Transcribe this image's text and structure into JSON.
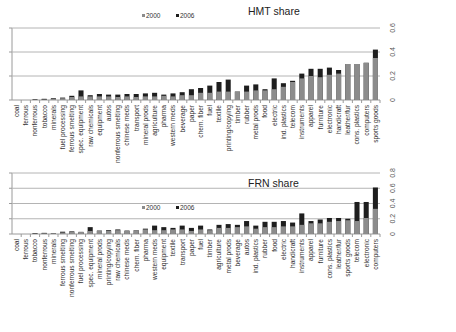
{
  "chart_data": [
    {
      "type": "bar",
      "stacked": "overlay",
      "title": "HMT share",
      "xlabel": "",
      "ylabel": "",
      "ylim": [
        0,
        0.6
      ],
      "yticks": [
        0,
        0.2,
        0.4,
        0.6
      ],
      "ytick_labels": [
        "0",
        "0.2",
        "0.4",
        "0.6"
      ],
      "grid": true,
      "legend": {
        "position": "inside-top-center",
        "entries": [
          "2000",
          "2006"
        ]
      },
      "categories": [
        "coal",
        "ferrous",
        "nonferrous",
        "tobacco",
        "minerals",
        "fuel processing",
        "ferrous smelting",
        "spec. equipment",
        "raw chemicals",
        "equipment",
        "autos",
        "nonferrous smelting",
        "chinese meds",
        "transport",
        "mineral prods",
        "agriculture",
        "pharma",
        "western meds",
        "beverage",
        "paper",
        "chem. fiber",
        "fuel",
        "textile",
        "printing/copying",
        "timber",
        "rubber",
        "metal prods",
        "food",
        "electric",
        "ind. plastics",
        "telecom",
        "instruments",
        "apparel",
        "furniture",
        "electronic",
        "handicraft",
        "leather/fur",
        "cons. plastics",
        "computers",
        "sports goods"
      ],
      "series": [
        {
          "name": "2000",
          "color": "#8c8c8c",
          "values": [
            0.0,
            0.0,
            0.0,
            0.005,
            0.01,
            0.015,
            0.025,
            0.03,
            0.03,
            0.03,
            0.03,
            0.025,
            0.03,
            0.025,
            0.03,
            0.03,
            0.035,
            0.03,
            0.04,
            0.04,
            0.06,
            0.06,
            0.07,
            0.07,
            0.07,
            0.07,
            0.08,
            0.08,
            0.09,
            0.11,
            0.15,
            0.18,
            0.2,
            0.19,
            0.21,
            0.22,
            0.3,
            0.3,
            0.31,
            0.35
          ]
        },
        {
          "name": "2006",
          "color": "#1e1e1e",
          "values": [
            0.0,
            0.0,
            0.005,
            0.01,
            0.015,
            0.02,
            0.035,
            0.08,
            0.04,
            0.05,
            0.045,
            0.045,
            0.05,
            0.05,
            0.055,
            0.06,
            0.045,
            0.055,
            0.065,
            0.09,
            0.1,
            0.12,
            0.15,
            0.17,
            0.07,
            0.12,
            0.13,
            0.09,
            0.18,
            0.14,
            0.16,
            0.22,
            0.26,
            0.26,
            0.27,
            0.25,
            0.3,
            0.3,
            0.31,
            0.42
          ]
        }
      ]
    },
    {
      "type": "bar",
      "stacked": "overlay",
      "title": "FRN share",
      "xlabel": "",
      "ylabel": "",
      "ylim": [
        0,
        0.8
      ],
      "yticks": [
        0,
        0.2,
        0.4,
        0.6,
        0.8
      ],
      "ytick_labels": [
        "0",
        "0.2",
        "0.4",
        "0.6",
        "0.8"
      ],
      "grid": true,
      "legend": {
        "position": "inside-top-center",
        "entries": [
          "2000",
          "2006"
        ]
      },
      "categories": [
        "coal",
        "ferrous",
        "tobacco",
        "nonferrous",
        "minerals",
        "ferrous smelting",
        "nonferrous smelting",
        "fuel processing",
        "spec. equipment",
        "mineral prods",
        "printing/copying",
        "raw chemicals",
        "chinese meds",
        "chem. fiber",
        "pharma",
        "western meds",
        "equipment",
        "textile",
        "transport",
        "paper",
        "fuel",
        "timber",
        "agriculture",
        "metal prods",
        "beverage",
        "autos",
        "ind. plastics",
        "rubber",
        "food",
        "electric",
        "handicraft",
        "instruments",
        "apparel",
        "furniture",
        "cons. plastics",
        "leather/fur",
        "sports goods",
        "telecom",
        "electronic",
        "computers"
      ],
      "series": [
        {
          "name": "2000",
          "color": "#8c8c8c",
          "values": [
            0.0,
            0.0,
            0.005,
            0.01,
            0.01,
            0.02,
            0.03,
            0.03,
            0.04,
            0.04,
            0.04,
            0.05,
            0.04,
            0.05,
            0.06,
            0.05,
            0.05,
            0.06,
            0.06,
            0.04,
            0.06,
            0.05,
            0.08,
            0.08,
            0.09,
            0.1,
            0.07,
            0.09,
            0.09,
            0.1,
            0.1,
            0.12,
            0.14,
            0.14,
            0.16,
            0.17,
            0.18,
            0.17,
            0.21,
            0.33
          ]
        },
        {
          "name": "2006",
          "color": "#1e1e1e",
          "values": [
            0.0,
            0.0,
            0.01,
            0.015,
            0.01,
            0.03,
            0.035,
            0.025,
            0.09,
            0.045,
            0.05,
            0.06,
            0.045,
            0.05,
            0.07,
            0.11,
            0.09,
            0.08,
            0.11,
            0.08,
            0.11,
            0.06,
            0.12,
            0.13,
            0.12,
            0.17,
            0.11,
            0.16,
            0.16,
            0.17,
            0.15,
            0.27,
            0.17,
            0.19,
            0.21,
            0.21,
            0.2,
            0.42,
            0.42,
            0.61
          ]
        }
      ]
    }
  ],
  "charts": [
    {
      "title": "HMT share",
      "legend_2000": "2000",
      "legend_2006": "2006"
    },
    {
      "title": "FRN share",
      "legend_2000": "2000",
      "legend_2006": "2006"
    }
  ]
}
